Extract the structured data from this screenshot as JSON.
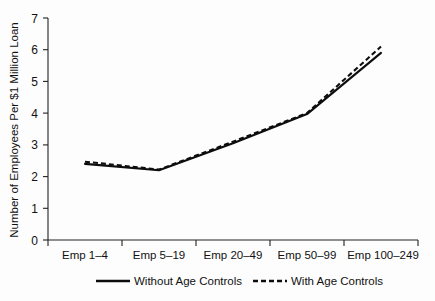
{
  "chart_data": {
    "type": "line",
    "title": "",
    "xlabel": "",
    "ylabel": "Number of Employees Per $1 Million Loan",
    "categories": [
      "Emp 1–4",
      "Emp 5–19",
      "Emp 20–49",
      "Emp 50–99",
      "Emp 100–249"
    ],
    "ylim": [
      0,
      7
    ],
    "ytick_labels": [
      "0",
      "1",
      "2",
      "3",
      "4",
      "5",
      "6",
      "7"
    ],
    "ytick_values": [
      0,
      1,
      2,
      3,
      4,
      5,
      6,
      7
    ],
    "grid": false,
    "legend_position": "bottom",
    "series": [
      {
        "name": "Without Age Controls",
        "style": "solid",
        "color": "#0d0d0d",
        "values": [
          2.4,
          2.2,
          3.05,
          3.97,
          5.9
        ]
      },
      {
        "name": "With Age Controls",
        "style": "dashed",
        "color": "#0d0d0d",
        "values": [
          2.47,
          2.22,
          3.1,
          4.0,
          6.1
        ]
      }
    ]
  },
  "legend": {
    "items": [
      {
        "label": "Without Age Controls",
        "style": "solid"
      },
      {
        "label": "With Age Controls",
        "style": "dashed"
      }
    ]
  }
}
